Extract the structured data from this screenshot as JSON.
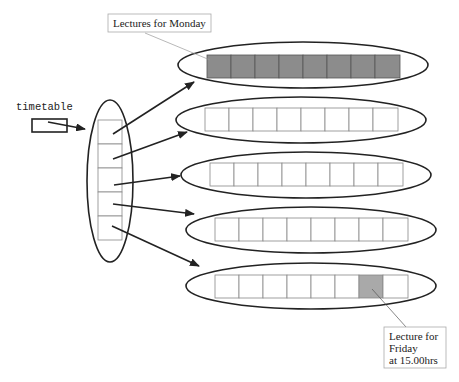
{
  "diagram": {
    "variable_label": "timetable",
    "callouts": {
      "monday": {
        "text": "Lectures for Monday"
      },
      "friday": {
        "lines": [
          "Lecture for",
          "Friday",
          "at 15.00hrs"
        ]
      }
    },
    "colors": {
      "filled_cell": "#8c8c8c",
      "highlight_cell": "#a9a9a9",
      "stroke": "#222222",
      "cell_border": "#888888"
    },
    "days": [
      {
        "name": "Monday",
        "cells": 8,
        "all_filled": true,
        "highlight_index": -1
      },
      {
        "name": "Tuesday",
        "cells": 8,
        "all_filled": false,
        "highlight_index": -1
      },
      {
        "name": "Wednesday",
        "cells": 8,
        "all_filled": false,
        "highlight_index": -1
      },
      {
        "name": "Thursday",
        "cells": 8,
        "all_filled": false,
        "highlight_index": -1
      },
      {
        "name": "Friday",
        "cells": 8,
        "all_filled": false,
        "highlight_index": 6
      }
    ],
    "outer_array_cells": 5
  }
}
